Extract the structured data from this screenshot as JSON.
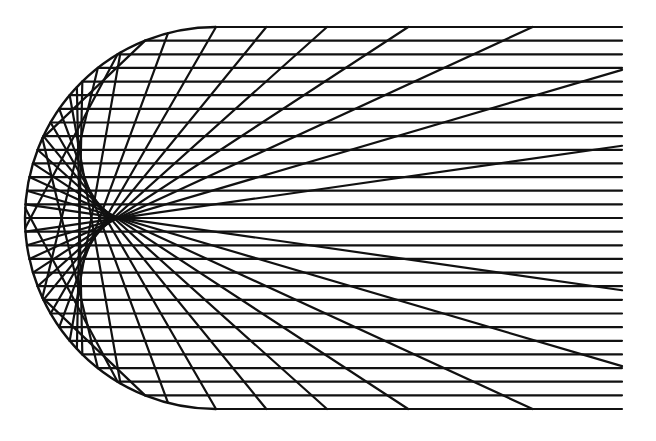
{
  "diagram": {
    "title": "",
    "type": "caustic-reflection",
    "colors": {
      "background": "#ffffff",
      "stroke": "#111111"
    },
    "geometry": {
      "center_x": 216,
      "center_y": 218,
      "radius": 191,
      "right_edge_x": 622,
      "ray_count": 29,
      "stroke_width": 2.2,
      "mirror_stroke_width": 2.4
    }
  }
}
